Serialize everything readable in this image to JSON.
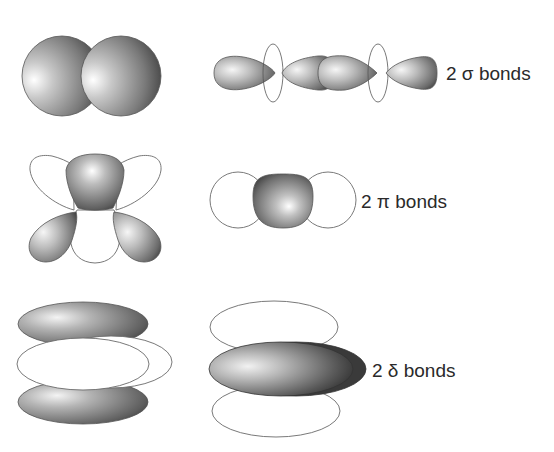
{
  "figure": {
    "rows": [
      {
        "id": "sigma",
        "label": "2 σ bonds",
        "count": "2",
        "symbol": "σ",
        "word": "bonds",
        "left_diagram": "two overlapping spheres (s-type overlap)",
        "right_diagram": "end-on overlap of p lobes along the bond axis"
      },
      {
        "id": "pi",
        "label": "2 π bonds",
        "count": "2",
        "symbol": "π",
        "word": "bonds",
        "left_diagram": "d-orbital cloverleaf with shaded and unshaded lobes",
        "right_diagram": "side-on overlap viewed along the axis"
      },
      {
        "id": "delta",
        "label": "2 δ bonds",
        "count": "2",
        "symbol": "δ",
        "word": "bonds",
        "left_diagram": "stacked face-on lobes (shaded, unshaded, shaded)",
        "right_diagram": "face-on overlap of stacked lobes"
      }
    ],
    "colors": {
      "background": "#ffffff",
      "shaded_dark": "#3a3a3a",
      "shaded_mid": "#8a8a8a",
      "shaded_light": "#f4f4f4",
      "outline": "#6a6a6a",
      "text": "#2a2a2a"
    }
  }
}
